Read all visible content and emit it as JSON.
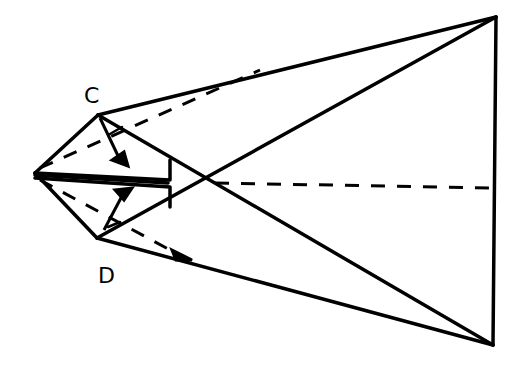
{
  "diagram": {
    "type": "origami-fold-diagram",
    "labels": {
      "c": "C",
      "d": "D"
    },
    "colors": {
      "stroke": "#000000",
      "background": "#ffffff"
    },
    "points": {
      "apex": [
        35,
        173
      ],
      "C": [
        98,
        115
      ],
      "D": [
        97,
        238
      ],
      "top_right": [
        496,
        17
      ],
      "bottom_right": [
        493,
        345
      ],
      "center_cross": [
        205,
        178
      ]
    }
  }
}
